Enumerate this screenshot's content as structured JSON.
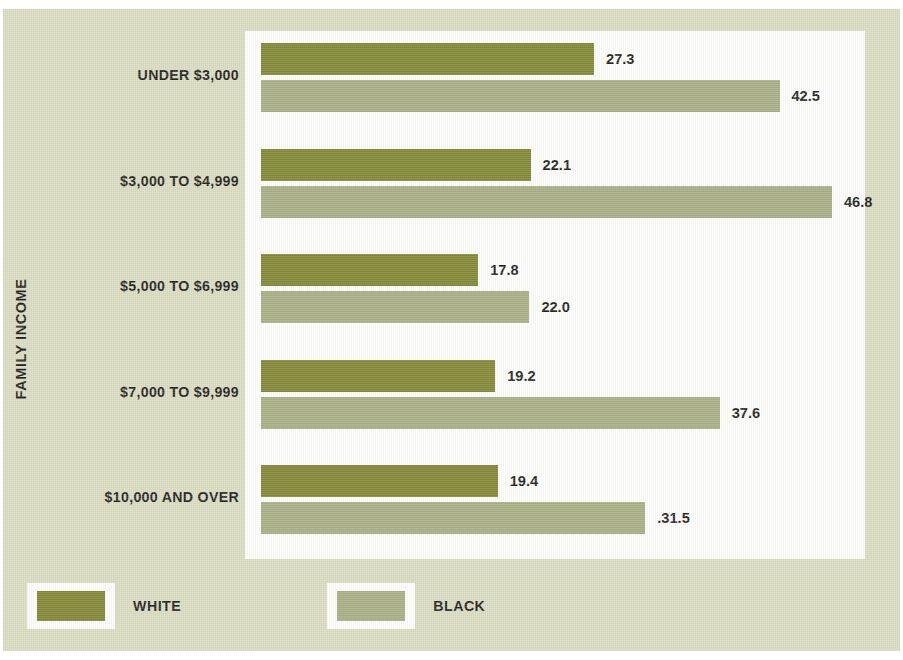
{
  "chart_data": {
    "type": "bar",
    "orientation": "horizontal",
    "title": "",
    "xlabel": "",
    "ylabel": "FAMILY INCOME",
    "grid": false,
    "legend_position": "bottom-left",
    "xlim": [
      0,
      50
    ],
    "value_format": "one-decimal percent",
    "categories": [
      "UNDER $3,000",
      "$3,000 TO $4,999",
      "$5,000 TO $6,999",
      "$7,000 TO $9,999",
      "$10,000 AND OVER"
    ],
    "series": [
      {
        "name": "WHITE",
        "color": "#7f8530",
        "values": [
          27.3,
          22.1,
          17.8,
          19.2,
          19.4
        ],
        "labels": [
          "27.3",
          "22.1",
          "17.8",
          "19.2",
          "19.4"
        ]
      },
      {
        "name": "BLACK",
        "color": "#a7ac83",
        "values": [
          42.5,
          46.8,
          22.0,
          37.6,
          31.5
        ],
        "labels": [
          "42.5",
          "46.8",
          "22.0",
          "37.6",
          ".31.5"
        ]
      }
    ]
  },
  "axis": {
    "y_title": "FAMILY INCOME"
  },
  "legend": {
    "items": [
      {
        "label": "WHITE",
        "color": "#7f8530"
      },
      {
        "label": "BLACK",
        "color": "#a7ac83"
      }
    ]
  },
  "colors": {
    "background": "#dadcc3",
    "panel": "#ffffff",
    "series_white": "#7f8530",
    "series_black": "#a7ac83",
    "text": "#1d1d1b"
  }
}
